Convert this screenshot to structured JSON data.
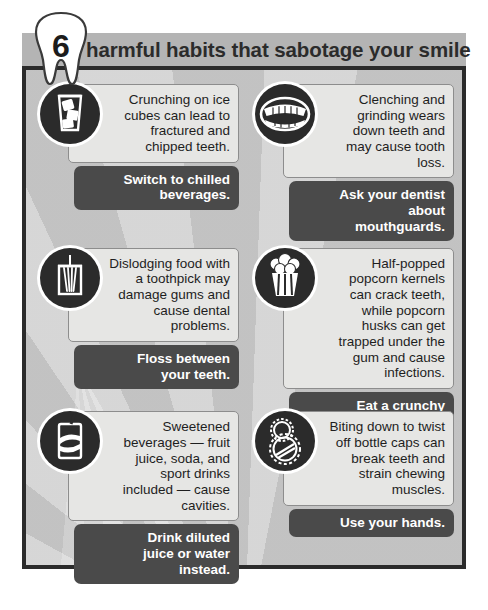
{
  "header": {
    "number": "6",
    "title": "harmful habits that sabotage your smile",
    "badge_icon": "tooth-icon"
  },
  "colors": {
    "frame_border": "#2b2b2b",
    "header_bar": "#b4b4b4",
    "card_body": "#e6e6e4",
    "card_advice": "#4a4a4a",
    "advice_text": "#ffffff",
    "body_text": "#1e1e1e",
    "background_light": "#d7d7d7",
    "background_dark": "#c2c2c2"
  },
  "tips": [
    {
      "icon": "ice-glass-icon",
      "body": "Crunching on ice cubes can lead to fractured and chipped teeth.",
      "advice": "Switch to chilled beverages."
    },
    {
      "icon": "open-mouth-teeth-icon",
      "body": "Clenching and grinding wears down teeth and may cause tooth loss.",
      "advice": "Ask your dentist about mouthguards."
    },
    {
      "icon": "toothpick-holder-icon",
      "body": "Dislodging food with a toothpick may damage gums and cause dental problems.",
      "advice": "Floss between your teeth."
    },
    {
      "icon": "popcorn-box-icon",
      "body": "Half-popped popcorn kernels can crack teeth, while popcorn husks can get trapped under the gum and cause infections.",
      "advice": "Eat a crunchy apple instead."
    },
    {
      "icon": "soda-can-icon",
      "body": "Sweetened beverages — fruit juice, soda, and sport drinks included — cause cavities.",
      "advice": "Drink diluted juice or water instead."
    },
    {
      "icon": "bottle-caps-icon",
      "body": "Biting down to twist off bottle caps can break teeth and strain chewing muscles.",
      "advice": "Use your hands."
    }
  ]
}
